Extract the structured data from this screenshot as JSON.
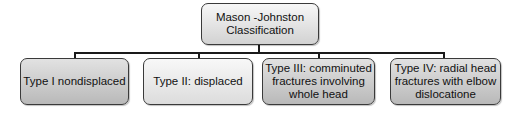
{
  "diagram": {
    "root": {
      "label_line1": "Mason -Johnston",
      "label_line2": "Classification"
    },
    "children": [
      {
        "label": "Type I nondisplaced"
      },
      {
        "label": "Type II: displaced"
      },
      {
        "label_line1": "Type III: comminuted",
        "label_line2": "fractures involving",
        "label_line3": "whole head"
      },
      {
        "label_line1": "Type IV: radial head",
        "label_line2": "fractures with elbow",
        "label_line3": "dislocatione"
      }
    ],
    "colors": {
      "border": "#3a3a3a",
      "connector": "#1a1a1a",
      "fill_light": "#f4f4f4",
      "fill_dark": "#c0c0c0"
    }
  }
}
